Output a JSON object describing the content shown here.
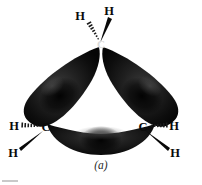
{
  "figure": {
    "caption": "(a)",
    "molecule": "cyclopropane",
    "ring_size": 3,
    "lobe_color": "#131313",
    "lobe_highlight_color": "#343434",
    "lobe_shadow_color": "#050505",
    "label_color": "#0a0a0a",
    "background_color": "#ffffff"
  },
  "atoms": {
    "carbon_top": {
      "label": "C",
      "x": 101,
      "y": 44
    },
    "carbon_left": {
      "label": "C",
      "x": 46,
      "y": 127
    },
    "carbon_right": {
      "label": "C",
      "x": 143,
      "y": 127
    },
    "hydrogen_top_left": {
      "label": "H",
      "x": 80,
      "y": 16
    },
    "hydrogen_top_right": {
      "label": "H",
      "x": 109,
      "y": 11
    },
    "hydrogen_left_side": {
      "label": "H",
      "x": 14,
      "y": 126
    },
    "hydrogen_left_lower": {
      "label": "H",
      "x": 13,
      "y": 153
    },
    "hydrogen_right_side": {
      "label": "H",
      "x": 174,
      "y": 126
    },
    "hydrogen_right_lower": {
      "label": "H",
      "x": 175,
      "y": 153
    }
  },
  "bonds": [
    {
      "name": "c-top-to-h-top-left",
      "style": "hashed-wedge",
      "from": "carbon_top",
      "to": "hydrogen_top_left"
    },
    {
      "name": "c-top-to-h-top-right",
      "style": "solid-wedge",
      "from": "carbon_top",
      "to": "hydrogen_top_right"
    },
    {
      "name": "c-left-to-h-side",
      "style": "hashed-wedge",
      "from": "carbon_left",
      "to": "hydrogen_left_side"
    },
    {
      "name": "c-left-to-h-lower",
      "style": "solid-wedge",
      "from": "carbon_left",
      "to": "hydrogen_left_lower"
    },
    {
      "name": "c-right-to-h-side",
      "style": "hashed-wedge",
      "from": "carbon_right",
      "to": "hydrogen_right_side"
    },
    {
      "name": "c-right-to-h-lower",
      "style": "solid-wedge",
      "from": "carbon_right",
      "to": "hydrogen_right_lower"
    }
  ],
  "orbital_lobes": [
    {
      "name": "bent-bond-lobe-upper-left",
      "between": [
        "carbon_top",
        "carbon_left"
      ]
    },
    {
      "name": "bent-bond-lobe-upper-right",
      "between": [
        "carbon_top",
        "carbon_right"
      ]
    },
    {
      "name": "bent-bond-lobe-bottom",
      "between": [
        "carbon_left",
        "carbon_right"
      ]
    }
  ]
}
